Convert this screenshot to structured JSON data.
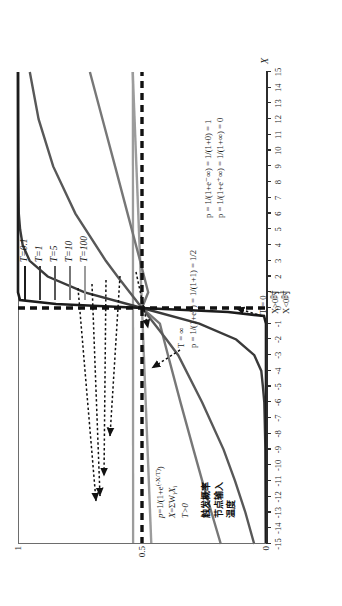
{
  "figure": {
    "orientation": "rotated-90-ccw",
    "background": "#ffffff"
  },
  "chart_data": {
    "type": "line",
    "title": "",
    "xlabel": "X",
    "ylabel": "",
    "xlim": [
      -15,
      15
    ],
    "ylim": [
      0,
      1
    ],
    "grid": false,
    "legend_position": "top-right",
    "x_ticks": [
      "-15",
      "-14",
      "-13",
      "-12",
      "-11",
      "-10",
      "-9",
      "-8",
      "-7",
      "-6",
      "-5",
      "-4",
      "-3",
      "-2",
      "-1",
      "0",
      "1",
      "2",
      "3",
      "4",
      "5",
      "6",
      "7",
      "8",
      "9",
      "10",
      "11",
      "12",
      "13",
      "14",
      "15"
    ],
    "y_ticks": [
      "0",
      "0.5",
      "1"
    ],
    "formula": "p = 1/(1+e^(-X/T))",
    "series": [
      {
        "name": "T=0.1",
        "T": 0.1,
        "color": "#1c1c1c",
        "x": [
          -15,
          -12,
          -9,
          -6,
          -3,
          -2,
          -1,
          -0.5,
          -0.2,
          0,
          0.2,
          0.5,
          1,
          2,
          3,
          6,
          9,
          12,
          15
        ],
        "values": [
          0,
          0,
          0,
          0,
          0,
          0,
          0,
          0.0067,
          0.1192,
          0.5,
          0.8808,
          0.9933,
          1,
          1,
          1,
          1,
          1,
          1,
          1
        ]
      },
      {
        "name": "T=1",
        "T": 1,
        "color": "#3a3a3a",
        "x": [
          -15,
          -12,
          -9,
          -6,
          -5,
          -4,
          -3,
          -2,
          -1,
          0,
          1,
          2,
          3,
          4,
          5,
          6,
          9,
          12,
          15
        ],
        "values": [
          3e-07,
          6e-06,
          0.00012,
          0.0025,
          0.0067,
          0.018,
          0.047,
          0.119,
          0.269,
          0.5,
          0.731,
          0.881,
          0.953,
          0.982,
          0.993,
          0.998,
          0.9999,
          1,
          1
        ]
      },
      {
        "name": "T=5",
        "T": 5,
        "color": "#585858",
        "x": [
          -15,
          -12,
          -9,
          -6,
          -3,
          -2,
          -1,
          0,
          1,
          2,
          3,
          6,
          9,
          12,
          15
        ],
        "values": [
          0.0474,
          0.0832,
          0.1419,
          0.2315,
          0.3543,
          0.4013,
          0.4502,
          0.5,
          0.5498,
          0.5987,
          0.6457,
          0.7685,
          0.8581,
          0.9168,
          0.9526
        ]
      },
      {
        "name": "T=10",
        "T": 10,
        "color": "#777777",
        "x": [
          -15,
          -12,
          -9,
          -6,
          -3,
          -2,
          -1,
          0,
          1,
          2,
          3,
          6,
          9,
          12,
          15
        ],
        "values": [
          0.1824,
          0.2315,
          0.2891,
          0.3543,
          0.4256,
          0.4502,
          0.475,
          0.5,
          0.525,
          0.5498,
          0.5744,
          0.6457,
          0.7109,
          0.7685,
          0.8176
        ]
      },
      {
        "name": "T=100",
        "T": 100,
        "color": "#9c9c9c",
        "x": [
          -15,
          -12,
          -9,
          -6,
          -3,
          0,
          3,
          6,
          9,
          12,
          15
        ],
        "values": [
          0.4625,
          0.47,
          0.4775,
          0.485,
          0.4925,
          0.5,
          0.5075,
          0.515,
          0.5225,
          0.53,
          0.5375
        ]
      },
      {
        "name": "T=0",
        "T": 0,
        "color": "#111111",
        "style": "dashed-step",
        "x": [
          -15,
          0,
          0,
          15
        ],
        "values": [
          0,
          0,
          1,
          1
        ]
      }
    ],
    "reference_lines": [
      {
        "name": "p-equals-half",
        "orientation": "horizontal",
        "value": 0.5,
        "style": "dashed",
        "color": "#111111"
      },
      {
        "name": "x-equals-zero",
        "orientation": "vertical",
        "value": 0,
        "style": "dashed",
        "color": "#111111"
      }
    ]
  },
  "legend": {
    "items": [
      {
        "label": "T=0.1",
        "color": "#1c1c1c"
      },
      {
        "label": "T=1",
        "color": "#3a3a3a"
      },
      {
        "label": "T=5",
        "color": "#585858"
      },
      {
        "label": "T=10",
        "color": "#777777"
      },
      {
        "label": "T=100",
        "color": "#9c9c9c"
      }
    ]
  },
  "annotations": {
    "formula_block": {
      "line1_prefix": "p",
      "line1_mid": "=1/(1+e",
      "line1_exp": "(-X/T)",
      "line1_suffix": ")",
      "line2_prefix": "X",
      "line2_mid": "=ΣW",
      "line2_sub": "i",
      "line2_suffix": "X",
      "line2_sub2": "i",
      "line3": "T>0"
    },
    "cjk_block": {
      "items": [
        "触发概率",
        "节点输入",
        "温度"
      ]
    },
    "t_infinity": {
      "line1": "T = ∞",
      "line2": "p = 1/(1+e⁰) = 1/(1+1) = 1/2"
    },
    "t_zero": {
      "line1": "T = 0",
      "line2": "X>0时",
      "line3": "X<0时"
    },
    "limits": {
      "line1": "p = 1/(1+e⁻∞) = 1/(1+0) = 1",
      "line2": "p = 1/(1+e⁺∞) = 1/(1+∞) = 0"
    }
  }
}
